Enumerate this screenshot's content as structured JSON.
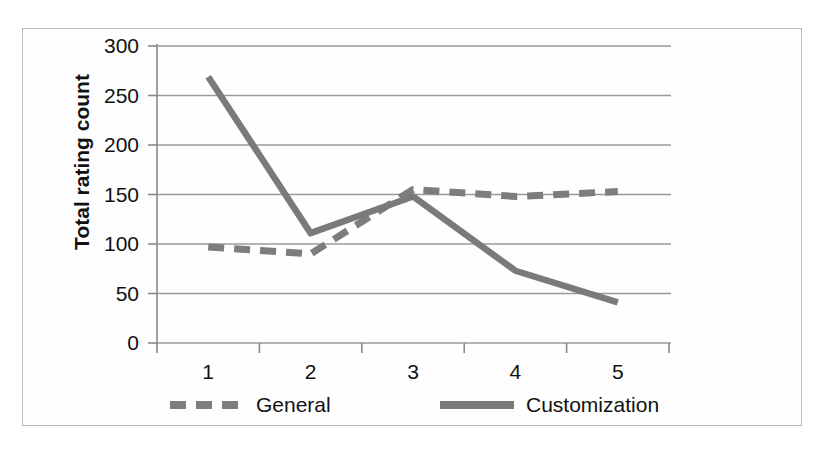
{
  "chart_data": {
    "type": "line",
    "title": "",
    "subtitle": "",
    "xlabel": "",
    "ylabel": "Total rating count",
    "categories": [
      "1",
      "2",
      "3",
      "4",
      "5"
    ],
    "x": [
      1,
      2,
      3,
      4,
      5
    ],
    "series": [
      {
        "name": "General",
        "style": "dashed",
        "color": "#7d7d7d",
        "values": [
          97,
          90,
          155,
          148,
          153
        ]
      },
      {
        "name": "Customization",
        "style": "solid",
        "color": "#7a7a7a",
        "values": [
          269,
          111,
          148,
          73,
          41
        ]
      }
    ],
    "ylim": [
      0,
      300
    ],
    "y_ticks": [
      0,
      50,
      100,
      150,
      200,
      250,
      300
    ],
    "y_tick_labels": [
      "0",
      "50",
      "100",
      "150",
      "200",
      "250",
      "300"
    ],
    "x_tick_labels": [
      "1",
      "2",
      "3",
      "4",
      "5"
    ],
    "grid": "horizontal",
    "legend_position": "bottom",
    "legend_entries": [
      "General",
      "Customization"
    ]
  },
  "axis": {
    "y_title": "Total rating count",
    "y_labels": [
      "300",
      "250",
      "200",
      "150",
      "100",
      "50",
      "0"
    ],
    "x_labels": [
      "1",
      "2",
      "3",
      "4",
      "5"
    ]
  },
  "legend": {
    "general_label": "General",
    "customization_label": "Customization"
  },
  "style": {
    "line_color_general": "#7d7d7d",
    "line_color_customization": "#7a7a7a",
    "grid_color": "#9a9a9a",
    "axis_color": "#8a8a8a",
    "frame_color": "#b9b9b9",
    "text_color": "#111111",
    "background": "#ffffff"
  }
}
